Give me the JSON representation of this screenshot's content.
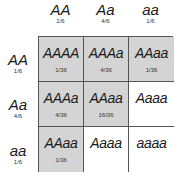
{
  "columns": [
    {
      "genotype": "AA",
      "freq": "1/6"
    },
    {
      "genotype": "Aa",
      "freq": "4/6"
    },
    {
      "genotype": "aa",
      "freq": "1/6"
    }
  ],
  "rows": [
    {
      "genotype": "AA",
      "freq": "1/6"
    },
    {
      "genotype": "Aa",
      "freq": "4/6"
    },
    {
      "genotype": "aa",
      "freq": "1/6"
    }
  ],
  "cells": [
    [
      {
        "genotype": "AAAA",
        "freq": "1/36",
        "shaded": true
      },
      {
        "genotype": "AAAa",
        "freq": "4/36",
        "shaded": true
      },
      {
        "genotype": "AAaa",
        "freq": "1/36",
        "shaded": true
      }
    ],
    [
      {
        "genotype": "AAAa",
        "freq": "4/36",
        "shaded": true
      },
      {
        "genotype": "AAaa",
        "freq": "16/36",
        "shaded": true
      },
      {
        "genotype": "Aaaa",
        "freq": "",
        "shaded": false
      }
    ],
    [
      {
        "genotype": "AAaa",
        "freq": "1/36",
        "shaded": true
      },
      {
        "genotype": "Aaaa",
        "freq": "",
        "shaded": false
      },
      {
        "genotype": "aaaa",
        "freq": "",
        "shaded": false
      }
    ]
  ],
  "colors": {
    "shaded": "#d4d4d4",
    "unshaded": "#ffffff",
    "border": "#555555"
  }
}
